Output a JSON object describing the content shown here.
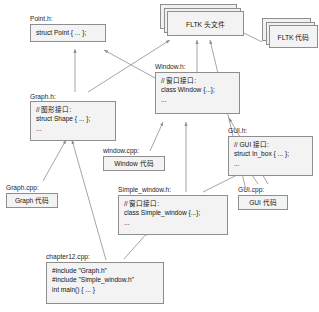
{
  "diagram": {
    "colors": {
      "box_fill": "#f3f3f3",
      "box_border": "#8e8e8e",
      "arrow": "#8e8e8e",
      "text": "#141414",
      "background": "#ffffff"
    },
    "nodes": {
      "point_h": {
        "caption": "Point.h:",
        "lines": [
          "struct Point { ... };"
        ]
      },
      "graph_h": {
        "caption": "Graph.h:",
        "lines": [
          "// 图形接口:",
          "struct Shape { ... };",
          "..."
        ]
      },
      "graph_cpp": {
        "caption": "Graph.cpp:",
        "lines": [
          "Graph 代码"
        ]
      },
      "window_h": {
        "caption": "Window.h:",
        "lines": [
          "// 窗口接口:",
          "class Window {...};",
          "..."
        ]
      },
      "window_cpp": {
        "caption": "window.cpp:",
        "lines": [
          "Window 代码"
        ]
      },
      "simple_window_h": {
        "caption": "Simple_window.h:",
        "lines": [
          "// 窗口接口:",
          "class Simple_window {...};",
          "..."
        ]
      },
      "gui_h": {
        "caption": "GUI.h:",
        "lines": [
          "// GUI 接口:",
          "struct In_box { ... };",
          "..."
        ]
      },
      "gui_cpp": {
        "caption": "GUI.cpp:",
        "lines": [
          "GUI 代码"
        ]
      },
      "chapter12_cpp": {
        "caption": "chapter12.cpp:",
        "lines": [
          "#include \"Graph.h\"",
          "#include \"Simple_window.h\"",
          "int main() { ... }"
        ]
      },
      "fltk_headers": {
        "label": "FLTK 头文件"
      },
      "fltk_code": {
        "label": "FLTK 代码"
      }
    }
  }
}
